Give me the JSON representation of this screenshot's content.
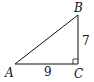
{
  "diagram": {
    "type": "right-triangle",
    "vertices": {
      "A": {
        "label": "A",
        "x": 15,
        "y": 64
      },
      "B": {
        "label": "B",
        "x": 78,
        "y": 15
      },
      "C": {
        "label": "C",
        "x": 78,
        "y": 64
      }
    },
    "sides": {
      "AC": {
        "label": "9"
      },
      "BC": {
        "label": "7"
      }
    },
    "right_angle_at": "C",
    "stroke_color": "#111111"
  }
}
